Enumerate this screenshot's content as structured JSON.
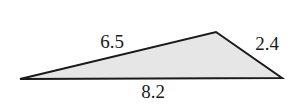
{
  "diagram": {
    "type": "triangle",
    "fill_color": "#e6e6e6",
    "stroke_color": "#1a1a1a",
    "vertices": [
      {
        "name": "left",
        "x": 20,
        "y": 79
      },
      {
        "name": "top",
        "x": 216,
        "y": 32
      },
      {
        "name": "right",
        "x": 282,
        "y": 78
      }
    ],
    "sides": {
      "left_top": {
        "label": "6.5",
        "x": 112,
        "y": 48
      },
      "top_right": {
        "label": "2.4",
        "x": 267,
        "y": 50
      },
      "bottom": {
        "label": "8.2",
        "x": 153,
        "y": 98
      }
    }
  }
}
